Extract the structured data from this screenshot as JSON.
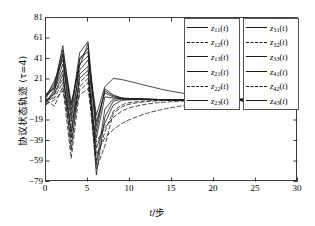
{
  "chart_data": {
    "type": "line",
    "title": "",
    "xlabel": "t/步",
    "ylabel": "协议状态轨迹 (τ=4)",
    "xlim": [
      0,
      30
    ],
    "ylim": [
      -79,
      81
    ],
    "xticks": [
      "0",
      "5",
      "10",
      "15",
      "20",
      "25",
      "30"
    ],
    "xtick_values": [
      0,
      5,
      10,
      15,
      20,
      25,
      30
    ],
    "yticks": [
      "81",
      "61",
      "41",
      "21",
      "1",
      "-19",
      "-39",
      "-59",
      "-79"
    ],
    "ytick_values": [
      81,
      61,
      41,
      21,
      1,
      -19,
      -39,
      -59,
      -79
    ],
    "grid": false,
    "legend_position": "top-right",
    "consensus_value": 1,
    "series": [
      {
        "name": "z11(t)",
        "label": "z11(t)",
        "style": "solid",
        "x": [
          0,
          1,
          2,
          3,
          4,
          5,
          6,
          7,
          8,
          9,
          10,
          12,
          14,
          16,
          18,
          20,
          22,
          24,
          26,
          28,
          30
        ],
        "values": [
          3,
          15,
          54,
          -9,
          47,
          58,
          -30,
          12,
          6,
          3,
          2.5,
          1.8,
          1.4,
          1.2,
          1.1,
          1.05,
          1.02,
          1.01,
          1.0,
          1.0,
          1.0
        ]
      },
      {
        "name": "z12(t)",
        "label": "z12(t)",
        "style": "dashed",
        "x": [
          0,
          1,
          2,
          3,
          4,
          5,
          6,
          7,
          8,
          9,
          10,
          12,
          14,
          16,
          18,
          20,
          22,
          24,
          26,
          28,
          30
        ],
        "values": [
          -4,
          6,
          22,
          -26,
          18,
          26,
          -52,
          -36,
          -28,
          -22,
          -18,
          -12,
          -8,
          -5,
          -3.2,
          -2,
          -1,
          -0.2,
          0.3,
          0.7,
          0.9
        ]
      },
      {
        "name": "z13(t)",
        "label": "z13(t)",
        "style": "solid",
        "x": [
          0,
          1,
          2,
          3,
          4,
          5,
          6,
          7,
          8,
          9,
          10,
          12,
          14,
          16,
          18,
          20,
          22,
          24,
          26,
          28,
          30
        ],
        "values": [
          6,
          12,
          36,
          -18,
          30,
          40,
          -20,
          8,
          4,
          2.5,
          2,
          1.6,
          1.3,
          1.15,
          1.08,
          1.04,
          1.02,
          1.01,
          1.0,
          1.0,
          1.0
        ]
      },
      {
        "name": "z21(t)",
        "label": "z21(t)",
        "style": "solid",
        "x": [
          0,
          1,
          2,
          3,
          4,
          5,
          6,
          7,
          8,
          9,
          10,
          12,
          14,
          16,
          18,
          20,
          22,
          24,
          26,
          28,
          30
        ],
        "values": [
          -2,
          9,
          46,
          -36,
          40,
          52,
          -62,
          -8,
          2,
          2.2,
          2,
          1.7,
          1.35,
          1.18,
          1.1,
          1.05,
          1.02,
          1.01,
          1.0,
          1.0,
          1.0
        ]
      },
      {
        "name": "z22(t)",
        "label": "z22(t)",
        "style": "dashed",
        "x": [
          0,
          1,
          2,
          3,
          4,
          5,
          6,
          7,
          8,
          9,
          10,
          12,
          14,
          16,
          18,
          20,
          22,
          24,
          26,
          28,
          30
        ],
        "values": [
          1,
          -5,
          14,
          -56,
          10,
          18,
          -66,
          -44,
          -12,
          -6,
          -3,
          -0.5,
          0.4,
          0.8,
          0.92,
          0.96,
          0.98,
          0.99,
          1.0,
          1.0,
          1.0
        ]
      },
      {
        "name": "z23(t)",
        "label": "z23(t)",
        "style": "solid",
        "x": [
          0,
          1,
          2,
          3,
          4,
          5,
          6,
          7,
          8,
          9,
          10,
          12,
          14,
          16,
          18,
          20,
          22,
          24,
          26,
          28,
          30
        ],
        "values": [
          4,
          20,
          40,
          -4,
          36,
          44,
          -14,
          14,
          22,
          21,
          19,
          15,
          11,
          8,
          5.5,
          3.8,
          2.7,
          2.0,
          1.6,
          1.3,
          1.1
        ]
      },
      {
        "name": "z31(t)",
        "label": "z31(t)",
        "style": "solid",
        "x": [
          0,
          1,
          2,
          3,
          4,
          5,
          6,
          7,
          8,
          9,
          10,
          12,
          14,
          16,
          18,
          20,
          22,
          24,
          26,
          28,
          30
        ],
        "values": [
          -1,
          11,
          30,
          -48,
          26,
          34,
          -72,
          -16,
          0,
          1.5,
          1.8,
          1.6,
          1.3,
          1.15,
          1.08,
          1.04,
          1.02,
          1.01,
          1.0,
          1.0,
          1.0
        ]
      },
      {
        "name": "z32(t)",
        "label": "z32(t)",
        "style": "dashed",
        "x": [
          0,
          1,
          2,
          3,
          4,
          5,
          6,
          7,
          8,
          9,
          10,
          12,
          14,
          16,
          18,
          20,
          22,
          24,
          26,
          28,
          30
        ],
        "values": [
          2,
          3,
          18,
          -40,
          14,
          22,
          -58,
          -30,
          -10,
          -4,
          -1.5,
          0.2,
          0.6,
          0.85,
          0.93,
          0.97,
          0.99,
          1.0,
          1.0,
          1.0,
          1.0
        ]
      },
      {
        "name": "z33(t)",
        "label": "z33(t)",
        "style": "solid",
        "x": [
          0,
          1,
          2,
          3,
          4,
          5,
          6,
          7,
          8,
          9,
          10,
          12,
          14,
          16,
          18,
          20,
          22,
          24,
          26,
          28,
          30
        ],
        "values": [
          5,
          17,
          44,
          -14,
          42,
          48,
          -24,
          10,
          5,
          3,
          2.2,
          1.7,
          1.35,
          1.18,
          1.1,
          1.05,
          1.02,
          1.01,
          1.0,
          1.0,
          1.0
        ]
      },
      {
        "name": "z41(t)",
        "label": "z41(t)",
        "style": "solid",
        "x": [
          0,
          1,
          2,
          3,
          4,
          5,
          6,
          7,
          8,
          9,
          10,
          12,
          14,
          16,
          18,
          20,
          22,
          24,
          26,
          28,
          30
        ],
        "values": [
          0,
          7,
          26,
          -30,
          22,
          30,
          -46,
          -22,
          -4,
          0.5,
          1.2,
          1.4,
          1.25,
          1.12,
          1.06,
          1.03,
          1.01,
          1.0,
          1.0,
          1.0,
          1.0
        ]
      },
      {
        "name": "z42(t)",
        "label": "z42(t)",
        "style": "dashed",
        "x": [
          0,
          1,
          2,
          3,
          4,
          5,
          6,
          7,
          8,
          9,
          10,
          12,
          14,
          16,
          18,
          20,
          22,
          24,
          26,
          28,
          30
        ],
        "values": [
          -3,
          1,
          10,
          -20,
          6,
          12,
          -40,
          -26,
          -16,
          -10,
          -6.5,
          -3,
          -1.2,
          -0.2,
          0.35,
          0.62,
          0.78,
          0.87,
          0.93,
          0.96,
          0.98
        ]
      },
      {
        "name": "z43(t)",
        "label": "z43(t)",
        "style": "solid",
        "x": [
          0,
          1,
          2,
          3,
          4,
          5,
          6,
          7,
          8,
          9,
          10,
          12,
          14,
          16,
          18,
          20,
          22,
          24,
          26,
          28,
          30
        ],
        "values": [
          7,
          13,
          50,
          -2,
          34,
          56,
          -36,
          4,
          3,
          2.4,
          2.1,
          1.75,
          1.4,
          1.2,
          1.1,
          1.05,
          1.02,
          1.01,
          1.0,
          1.0,
          1.0
        ]
      }
    ]
  },
  "legends": [
    {
      "id": "legend-1",
      "entries": [
        {
          "base": "z",
          "sub": "11",
          "arg": "(t)",
          "style": "solid"
        },
        {
          "base": "z",
          "sub": "12",
          "arg": "(t)",
          "style": "dashed"
        },
        {
          "base": "z",
          "sub": "13",
          "arg": "(t)",
          "style": "solid"
        },
        {
          "base": "z",
          "sub": "21",
          "arg": "(t)",
          "style": "solid"
        },
        {
          "base": "z",
          "sub": "22",
          "arg": "(t)",
          "style": "dashed"
        },
        {
          "base": "z",
          "sub": "23",
          "arg": "(t)",
          "style": "solid"
        }
      ]
    },
    {
      "id": "legend-2",
      "entries": [
        {
          "base": "z",
          "sub": "31",
          "arg": "(t)",
          "style": "solid"
        },
        {
          "base": "z",
          "sub": "32",
          "arg": "(t)",
          "style": "dashed"
        },
        {
          "base": "z",
          "sub": "33",
          "arg": "(t)",
          "style": "solid"
        },
        {
          "base": "z",
          "sub": "41",
          "arg": "(t)",
          "style": "solid"
        },
        {
          "base": "z",
          "sub": "42",
          "arg": "(t)",
          "style": "dashed"
        },
        {
          "base": "z",
          "sub": "43",
          "arg": "(t)",
          "style": "solid"
        }
      ]
    }
  ],
  "colors": {
    "line": "#1a1a1a",
    "axis": "#3a3a3a",
    "background": "#ffffff"
  }
}
